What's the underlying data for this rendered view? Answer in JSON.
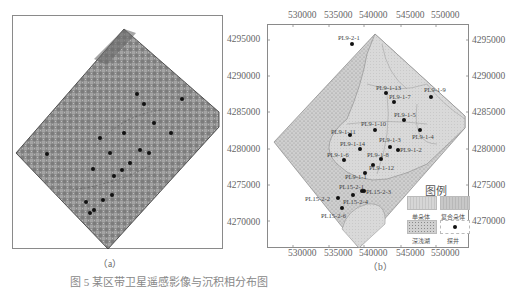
{
  "figure": {
    "panel_a": {
      "caption": "（a）",
      "y_axis_ticks": [
        "4295000",
        "4290000",
        "4285000",
        "4280000",
        "4275000",
        "4270000"
      ]
    },
    "panel_b": {
      "caption": "（b）",
      "x_axis_ticks": [
        "530000",
        "535000",
        "540000",
        "545000",
        "550000"
      ],
      "y_axis_ticks": [
        "4295000",
        "4290000",
        "4285000",
        "4280000",
        "4275000",
        "4270000"
      ],
      "wells": [
        {
          "label": "PL9-2-1"
        },
        {
          "label": "PL9-1-13"
        },
        {
          "label": "PL9-1-7"
        },
        {
          "label": "PL9-1-9"
        },
        {
          "label": "PL9-1-5"
        },
        {
          "label": "PL9-1-10"
        },
        {
          "label": "PL9-1-11"
        },
        {
          "label": "PL9-1-4"
        },
        {
          "label": "PL9-1-3"
        },
        {
          "label": "PL9-1-14"
        },
        {
          "label": "PL9-1-2"
        },
        {
          "label": "PL9-1-6"
        },
        {
          "label": "PL9-1-8"
        },
        {
          "label": "PL9-1-12"
        },
        {
          "label": "PL9-1-1"
        },
        {
          "label": "PL15-2-1"
        },
        {
          "label": "PL15-2-3"
        },
        {
          "label": "PL15-2-2"
        },
        {
          "label": "PL15-2-4"
        },
        {
          "label": "PL15-2-6"
        }
      ],
      "legend": {
        "title": "图例",
        "items": [
          {
            "label": "单朵体",
            "type": "single-lobe",
            "color": "#d6d6d6"
          },
          {
            "label": "复合朵体",
            "type": "composite-lobe",
            "color": "#c8c8c8"
          },
          {
            "label": "深浅湖",
            "type": "deep-shallow-lake",
            "color": "#bdbdbd"
          },
          {
            "label": "探井",
            "type": "exploration-well",
            "color": "#111111"
          }
        ]
      }
    },
    "caption_line": "图 5  某区带卫星遥感影像与沉积相分布图"
  }
}
